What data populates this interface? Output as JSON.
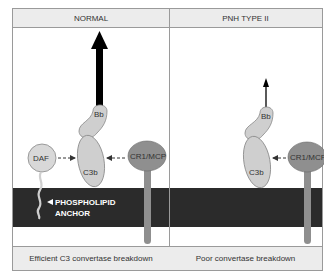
{
  "panels": {
    "left": {
      "title": "NORMAL",
      "caption": "Efficient C3 convertase breakdown",
      "labels": {
        "bb": "Bb",
        "c3b": "C3b",
        "daf": "DAF",
        "cr1": "CR1/MCP",
        "anchor_line1": "PHOSPHOLIPID",
        "anchor_line2": "ANCHOR"
      },
      "bb_release": "strong"
    },
    "right": {
      "title": "PNH TYPE II",
      "caption": "Poor convertase breakdown",
      "labels": {
        "bb": "Bb",
        "c3b": "C3b",
        "cr1": "CR1/MCP"
      },
      "bb_release": "weak"
    }
  },
  "colors": {
    "membrane": "#2b2b2b",
    "protein_light": "#cfcfcf",
    "protein_dark": "#8f8f8f",
    "header_bg": "#ececec",
    "border": "#9a9a9a"
  }
}
